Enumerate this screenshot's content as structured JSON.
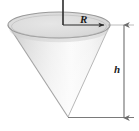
{
  "figure": {
    "kind": "geometry-diagram",
    "shape": "inverted-cone",
    "background_color": "#ffffff",
    "outline_color": "#9a9a9a",
    "shade_dark_color": "#c9c9c9",
    "shade_light_color": "#fbfbfb",
    "dimension_color": "#6e6e6e",
    "axis_color": "#2b2b2b",
    "labels": {
      "radius": "R",
      "height": "h"
    },
    "geometry": {
      "rim_center_x": 59,
      "rim_center_y": 25,
      "rim_radius_x": 51,
      "rim_radius_y": 13,
      "apex_x": 68,
      "apex_y": 117,
      "axis_top_y": 0,
      "dimension_line_x": 124,
      "dimension_top_y": 25,
      "dimension_bottom_y": 118,
      "baseline_y": 117,
      "baseline_left_x": 68,
      "baseline_right_x": 134
    },
    "annotations": [
      {
        "name": "radius-dimension",
        "label": "R",
        "from": "cone-axis",
        "to": "rim-right-edge"
      },
      {
        "name": "height-dimension",
        "label": "h",
        "from": "rim-level",
        "to": "cone-apex"
      }
    ]
  }
}
